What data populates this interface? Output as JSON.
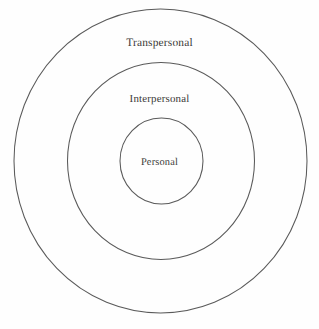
{
  "figure": {
    "type": "concentric-circles-diagram",
    "title": "",
    "background_color": "#fefefe",
    "stroke_color": "#5a5a5a",
    "text_color": "#3b3a38",
    "rings": [
      {
        "id": "transpersonal",
        "label": "Transpersonal",
        "level": 3,
        "position": "outer",
        "center_x": 160.5,
        "center_y": 161,
        "radius_x": 146.5,
        "radius_y": 152,
        "label_y": 43
      },
      {
        "id": "interpersonal",
        "label": "Interpersonal",
        "level": 2,
        "position": "middle",
        "center_x": 161,
        "center_y": 161,
        "radius_x": 93.5,
        "radius_y": 98.5,
        "label_y": 99
      },
      {
        "id": "personal",
        "label": "Personal",
        "level": 1,
        "position": "inner",
        "center_x": 161.5,
        "center_y": 161,
        "radius_x": 41.5,
        "radius_y": 43,
        "label_y": 162
      }
    ]
  }
}
